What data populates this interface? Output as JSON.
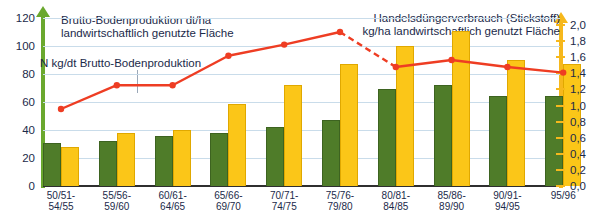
{
  "chart_data": {
    "type": "bar",
    "title": "",
    "categories": [
      "50/51-\n54/55",
      "55/56-\n59/60",
      "60/61-\n64/65",
      "65/66-\n69/70",
      "70/71-\n74/75",
      "75/76-\n79/80",
      "80/81-\n84/85",
      "85/86-\n89/90",
      "90/91-\n94/95",
      "95/96"
    ],
    "series": [
      {
        "name": "Brutto-Bodenproduktion dt/ha landwirtschaftlich genutzte Fläche",
        "axis": "left",
        "type": "bar",
        "color": "#4f7c29",
        "values": [
          31,
          32,
          36,
          38,
          42,
          47,
          69,
          72,
          64,
          64
        ]
      },
      {
        "name": "Handelsdüngerverbrauch (Stickstoff) kg/ha landwirtschaftlich genutzt Fläche",
        "axis": "right",
        "type": "bar",
        "color": "#fbc618",
        "values": [
          0.49,
          0.66,
          0.7,
          1.02,
          1.25,
          1.52,
          1.74,
          1.92,
          1.57,
          1.52
        ]
      },
      {
        "name": "N kg/dt Brutto-Bodenproduktion",
        "axis": "left",
        "type": "line",
        "color": "#ee3d23",
        "values": [
          55,
          72,
          72,
          93,
          101,
          110,
          85,
          90,
          85,
          81
        ],
        "dashed_segments": [
          [
            5,
            6
          ]
        ]
      }
    ],
    "axis_left": {
      "label": "Brutto-Bodenproduktion dt/ha\nlandwirtschaftlich genutzte Fläche",
      "ticks": [
        "0",
        "20",
        "40",
        "60",
        "80",
        "100",
        "120"
      ],
      "tick_values": [
        0,
        20,
        40,
        60,
        80,
        100,
        120
      ],
      "min": 0,
      "max": 120,
      "color": "#6aa82e"
    },
    "axis_right": {
      "label": "Handelsdüngerverbrauch (Stickstoff)\nkg/ha landwirtschaftlich genutzt Fläche",
      "ticks": [
        "0,0",
        "0,2",
        "0,4",
        "0,6",
        "0,8",
        "1,0",
        "1,2",
        "1,4",
        "1,6",
        "1,8",
        "2,0"
      ],
      "tick_values": [
        0,
        0.2,
        0.4,
        0.6,
        0.8,
        1.0,
        1.2,
        1.4,
        1.6,
        1.8,
        2.0
      ],
      "min": 0,
      "max": 2.0,
      "color": "#f6b81c"
    },
    "annotation": "N kg/dt Brutto-Bodenproduktion",
    "xlabel": "",
    "grid": true,
    "legend": "none",
    "colors": {
      "bar_green": "#4f7c29",
      "bar_yellow": "#fbc618",
      "line_red": "#ee3d23",
      "gridline": "#c9dcea",
      "text": "#1b2a4a",
      "background": "#ffffff"
    }
  }
}
